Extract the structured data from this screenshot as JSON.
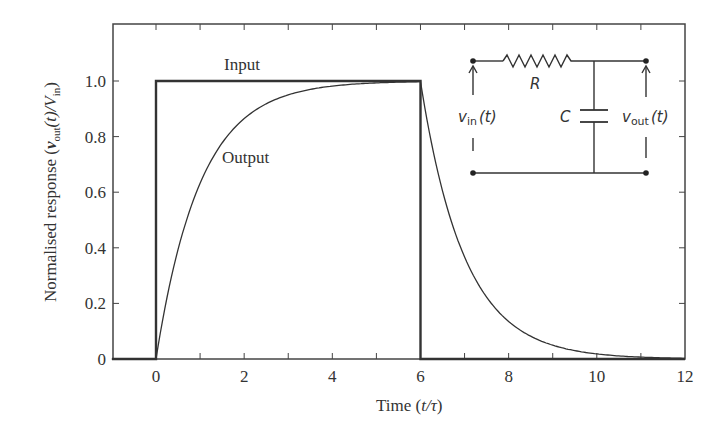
{
  "chart_data": {
    "type": "line",
    "title": "",
    "xlabel": "Time (t/τ)",
    "ylabel": "Normalised response (v_out(t)/V_in)",
    "xlim": [
      -1,
      12
    ],
    "ylim": [
      0,
      1.2
    ],
    "xticks": [
      0,
      2,
      4,
      6,
      8,
      10,
      12
    ],
    "xtick_labels": [
      "0",
      "2",
      "4",
      "6",
      "8",
      "10",
      "12"
    ],
    "xminor_ticks": [
      -1,
      1,
      3,
      5,
      7,
      9,
      11
    ],
    "yticks": [
      0,
      0.2,
      0.4,
      0.6,
      0.8,
      1.0
    ],
    "ytick_labels": [
      "0",
      "0.2",
      "0.4",
      "0.6",
      "0.8",
      "1.0"
    ],
    "grid": false,
    "legend": "none (inline annotations)",
    "series": [
      {
        "name": "Input",
        "description": "Rectangular pulse of amplitude 1 from t=0 to t=6",
        "x": [
          -1,
          0,
          0,
          6,
          6,
          12
        ],
        "y": [
          0,
          0,
          1,
          1,
          0,
          0
        ]
      },
      {
        "name": "Output",
        "description": "RC charging 1-exp(-t) for 0<=t<=6, then discharge exp(-(t-6)) for t>6",
        "x": [
          -1,
          0,
          0.5,
          1,
          1.5,
          2,
          3,
          4,
          5,
          6,
          6.5,
          7,
          7.5,
          8,
          9,
          10,
          11,
          12
        ],
        "y": [
          0,
          0,
          0.39,
          0.63,
          0.78,
          0.86,
          0.95,
          0.98,
          0.99,
          1.0,
          0.61,
          0.37,
          0.22,
          0.14,
          0.05,
          0.02,
          0.007,
          0.002
        ]
      }
    ],
    "annotations": [
      {
        "text": "Input",
        "x": 2.0,
        "y": 1.07
      },
      {
        "text": "Output",
        "x": 2.1,
        "y": 0.73
      }
    ],
    "inset": {
      "type": "circuit-diagram",
      "description": "RC low-pass filter",
      "components": [
        {
          "label": "R",
          "kind": "resistor"
        },
        {
          "label": "C",
          "kind": "capacitor"
        }
      ],
      "input_label": "v_in(t)",
      "output_label": "v_out(t)"
    }
  },
  "labels": {
    "xlabel_main": "Time (",
    "xlabel_var": "t/τ",
    "xlabel_close": ")",
    "ylabel_main": "Normalised response  (",
    "ylabel_v": "v",
    "ylabel_out_sub": "out",
    "ylabel_t": "(t)/",
    "ylabel_V": "V",
    "ylabel_in_sub": "in",
    "ylabel_close": ")",
    "input_anno": "Input",
    "output_anno": "Output",
    "circuit_R": "R",
    "circuit_C": "C",
    "vin_v": "v",
    "vin_sub": "in",
    "vin_t": "(t)",
    "vout_v": "v",
    "vout_sub": "out",
    "vout_t": "(t)"
  },
  "layout": {
    "plot_left": 113,
    "plot_right": 685,
    "plot_top": 24,
    "plot_bottom": 359,
    "x0_px": 156,
    "px_per_x": 44.08,
    "px_per_y": 278,
    "line_color": "#333333"
  }
}
